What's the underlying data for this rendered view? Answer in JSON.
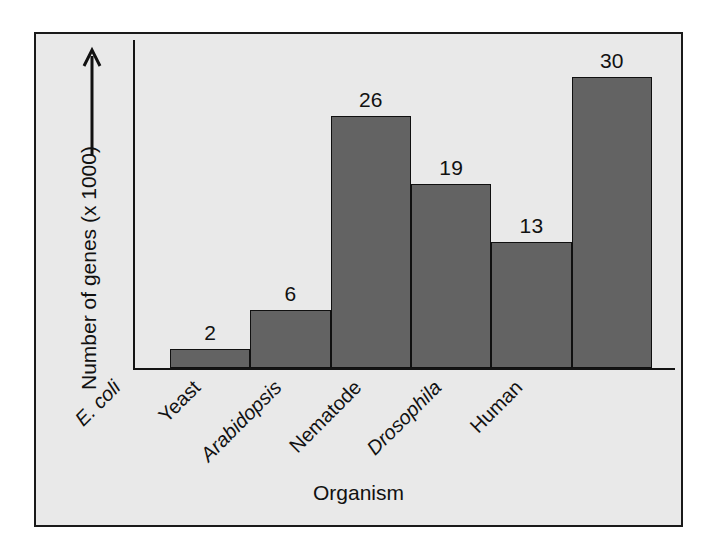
{
  "chart_data": {
    "type": "bar",
    "title": "",
    "xlabel": "Organism",
    "ylabel": "Number of genes (x 1000)",
    "ylim": [
      0,
      34
    ],
    "grid": false,
    "legend": "none",
    "axis_arrow": "up-arrow",
    "categories": [
      "E. coli",
      "Yeast",
      "Arabidopsis",
      "Nematode",
      "Drosophila",
      "Human"
    ],
    "categories_italic": [
      true,
      false,
      true,
      false,
      true,
      false
    ],
    "values": [
      2,
      6,
      26,
      19,
      13,
      30
    ],
    "value_labels": [
      "2",
      "6",
      "26",
      "19",
      "13",
      "30"
    ],
    "colors": {
      "bar_fill": "#636363",
      "bar_outline": "#101010",
      "plot_background": "#e9e9e9",
      "axis": "#141414",
      "text": "#111111",
      "frame_border": "#1a1a1a"
    }
  }
}
